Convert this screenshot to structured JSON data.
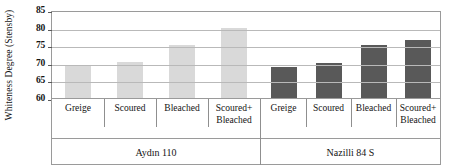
{
  "chart_data": {
    "type": "bar",
    "title": "",
    "xlabel": "",
    "ylabel": "Whiteness Degree (Stensby)",
    "ylim": [
      60,
      85
    ],
    "yticks": [
      60,
      65,
      70,
      75,
      80,
      85
    ],
    "grid": true,
    "legend": "none",
    "categories": [
      "Greige",
      "Scoured",
      "Bleached",
      "Scoured+\nBleached"
    ],
    "groups": [
      {
        "name": "Aydın 110",
        "color": "#d9d9d9",
        "categories": [
          "Greige",
          "Scoured",
          "Bleached",
          "Scoured+ Bleached"
        ],
        "values": [
          69.3,
          70.2,
          75.0,
          80.0
        ]
      },
      {
        "name": "Nazilli 84 S",
        "color": "#595959",
        "categories": [
          "Greige",
          "Scoured",
          "Bleached",
          "Scoured+ Bleached"
        ],
        "values": [
          68.8,
          70.0,
          75.2,
          76.5
        ]
      }
    ]
  },
  "axis": {
    "y_title": "Whiteness Degree (Stensby)",
    "y_tick_labels": [
      "85",
      "80",
      "75",
      "70",
      "65",
      "60"
    ]
  },
  "category_labels": {
    "greige": "Greige",
    "scoured": "Scoured",
    "bleached": "Bleached",
    "scoured_bleached_line1": "Scoured+",
    "scoured_bleached_line2": "Bleached"
  },
  "group_labels": {
    "group1": "Aydın 110",
    "group2": "Nazilli 84 S"
  },
  "colors": {
    "series_light": "#d9d9d9",
    "series_dark": "#595959",
    "gridline": "#b9b9b9",
    "frame": "#9a9a9a",
    "text": "#141414"
  }
}
